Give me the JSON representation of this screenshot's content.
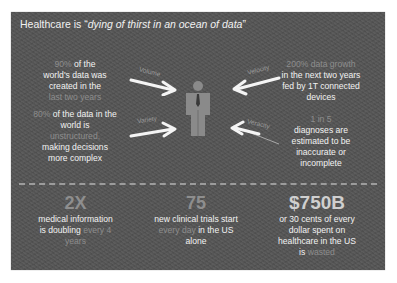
{
  "title": {
    "prefix": "Healthcare is “",
    "quote": "dying of thirst in an ocean of data",
    "suffix": "”"
  },
  "center": {
    "icon": "person-with-tie-icon",
    "arrows": [
      {
        "label": "Volume",
        "position": "top-left"
      },
      {
        "label": "Velocity",
        "position": "top-right"
      },
      {
        "label": "Variety",
        "position": "bottom-left"
      },
      {
        "label": "Veracity",
        "position": "bottom-right"
      }
    ]
  },
  "facts": {
    "left_top": {
      "highlight": "90%",
      "line1": " of the",
      "line2": "world's data was",
      "line3": "created in the",
      "highlight2": "last two years"
    },
    "left_bottom": {
      "highlight": "80%",
      "line1": " of the data in the",
      "line2": "world is",
      "highlight2": "unstructured,",
      "line3": "making decisions",
      "line4": "more complex"
    },
    "right_top": {
      "highlight": "200% data growth",
      "line1": "in the next two years",
      "line2": "fed by 1T connected",
      "line3": "devices"
    },
    "right_bottom": {
      "highlight": "1 in 5",
      "line1": "diagnoses are",
      "line2": "estimated to be",
      "line3": "inaccurate or",
      "line4": "incomplete"
    }
  },
  "stats": [
    {
      "value": "2X",
      "line1": "medical information",
      "line2": "is doubling ",
      "highlight": "every 4",
      "highlight2": "years"
    },
    {
      "value": "75",
      "line1": "new clinical trials start",
      "highlight": "every day",
      "line2": " in the US",
      "line3": "alone"
    },
    {
      "value": "$750B",
      "line1": "or 30 cents of every",
      "line2": "dollar spent on",
      "line3": "healthcare in the US",
      "line4": "is ",
      "highlight": "wasted"
    }
  ],
  "colors": {
    "panel_bg": "#545454",
    "text": "#f2f2f2",
    "highlight": "#8d8d8d"
  }
}
